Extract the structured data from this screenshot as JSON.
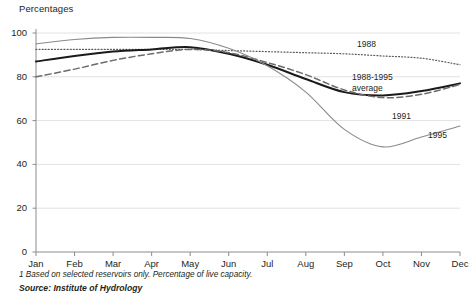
{
  "chart_title": "Percentages",
  "footnote": "1 Based on selected reservoirs only. Percentage of live capacity.",
  "source": "Source: Institute of Hydrology",
  "axis": {
    "y_ticks": [
      "0",
      "20",
      "40",
      "60",
      "80",
      "100"
    ],
    "x_ticks": [
      "Jan",
      "Feb",
      "Mar",
      "Apr",
      "May",
      "Jun",
      "Jul",
      "Aug",
      "Sep",
      "Oct",
      "Nov",
      "Dec"
    ]
  },
  "series_labels": {
    "s1988": "1988",
    "average_line1": "1988-1995",
    "average_line2": "average",
    "s1991": "1991",
    "s1995": "1995"
  },
  "colors": {
    "axis": "#8c8c8c",
    "grid": "#e2e2e2",
    "average": "#1a1a1a",
    "s1988": "#5a5a5a",
    "s1991": "#6b6b6b",
    "s1995": "#8a8a8a",
    "text": "#231f20"
  },
  "chart_data": {
    "type": "line",
    "title": "Percentages",
    "xlabel": "",
    "ylabel": "Percentages",
    "ylim": [
      0,
      100
    ],
    "yticks": [
      0,
      20,
      40,
      60,
      80,
      100
    ],
    "grid": true,
    "legend": "inline-annotations",
    "categories": [
      "Jan",
      "Feb",
      "Mar",
      "Apr",
      "May",
      "Jun",
      "Jul",
      "Aug",
      "Sep",
      "Oct",
      "Nov",
      "Dec"
    ],
    "series": [
      {
        "name": "1988",
        "style": "dotted",
        "values": [
          92.5,
          92.5,
          92.5,
          92.5,
          92.5,
          92.0,
          91.5,
          91.0,
          90.5,
          89.5,
          88.5,
          85.5
        ]
      },
      {
        "name": "1988-1995 average",
        "style": "solid-bold",
        "values": [
          87.0,
          89.5,
          91.5,
          92.5,
          93.5,
          90.5,
          85.5,
          79.0,
          73.0,
          71.5,
          73.5,
          77.0
        ]
      },
      {
        "name": "1991",
        "style": "dashed",
        "values": [
          80.0,
          83.5,
          87.5,
          90.5,
          92.5,
          91.0,
          86.5,
          81.0,
          74.0,
          70.5,
          72.0,
          76.5
        ]
      },
      {
        "name": "1995",
        "style": "solid-thin",
        "values": [
          95.0,
          97.0,
          98.0,
          98.0,
          97.5,
          93.0,
          85.0,
          73.0,
          56.0,
          48.0,
          52.5,
          57.5
        ]
      }
    ]
  }
}
